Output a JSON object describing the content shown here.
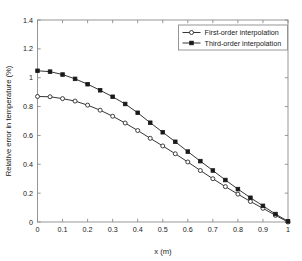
{
  "chart_data": {
    "type": "line",
    "title": "",
    "xlabel": "x (m)",
    "ylabel": "Relative error in temperature (%)",
    "xlim": [
      0,
      1
    ],
    "ylim": [
      0,
      1.4
    ],
    "xticks": [
      "0",
      "0.1",
      "0.2",
      "0.3",
      "0.4",
      "0.5",
      "0.6",
      "0.7",
      "0.8",
      "0.9",
      "1"
    ],
    "xtick_values": [
      0,
      0.1,
      0.2,
      0.3,
      0.4,
      0.5,
      0.6,
      0.7,
      0.8,
      0.9,
      1
    ],
    "yticks": [
      "0",
      "0.2",
      "0.4",
      "0.6",
      "0.8",
      "1",
      "1.2",
      "1.4"
    ],
    "ytick_values": [
      0,
      0.2,
      0.4,
      0.6,
      0.8,
      1.0,
      1.2,
      1.4
    ],
    "grid": false,
    "legend_position": "top-right",
    "x": [
      0,
      0.05,
      0.1,
      0.15,
      0.2,
      0.25,
      0.3,
      0.35,
      0.4,
      0.45,
      0.5,
      0.55,
      0.6,
      0.65,
      0.7,
      0.75,
      0.8,
      0.85,
      0.9,
      0.95,
      1
    ],
    "series": [
      {
        "name": "First-order interpolation",
        "marker": "open-circle",
        "color": "#2b2b2b",
        "values": [
          0.87,
          0.868,
          0.855,
          0.838,
          0.81,
          0.775,
          0.733,
          0.686,
          0.634,
          0.58,
          0.527,
          0.473,
          0.416,
          0.357,
          0.3,
          0.245,
          0.193,
          0.142,
          0.095,
          0.046,
          0.0
        ]
      },
      {
        "name": "Third-order interpolation",
        "marker": "filled-square",
        "color": "#1a1a1a",
        "values": [
          1.048,
          1.042,
          1.022,
          0.992,
          0.955,
          0.913,
          0.868,
          0.818,
          0.757,
          0.688,
          0.622,
          0.556,
          0.488,
          0.422,
          0.357,
          0.291,
          0.228,
          0.168,
          0.112,
          0.055,
          0.005
        ]
      }
    ]
  },
  "legend": {
    "entries": [
      {
        "label": "First-order interpolation"
      },
      {
        "label": "Third-order interpolation"
      }
    ]
  },
  "axes": {
    "x_title": "x (m)",
    "y_title": "Relative error in temperature (%)"
  }
}
